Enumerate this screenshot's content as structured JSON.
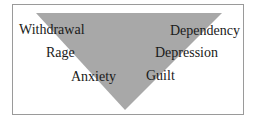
{
  "diagram": {
    "shape": "inverted-triangle",
    "colors": {
      "triangle": "#a8a8a8",
      "border": "#9a9a9a",
      "text": "#1a1a1a"
    },
    "left_labels": [
      "Withdrawal",
      "Rage",
      "Anxiety"
    ],
    "right_labels": [
      "Dependency",
      "Depression",
      "Guilt"
    ]
  }
}
